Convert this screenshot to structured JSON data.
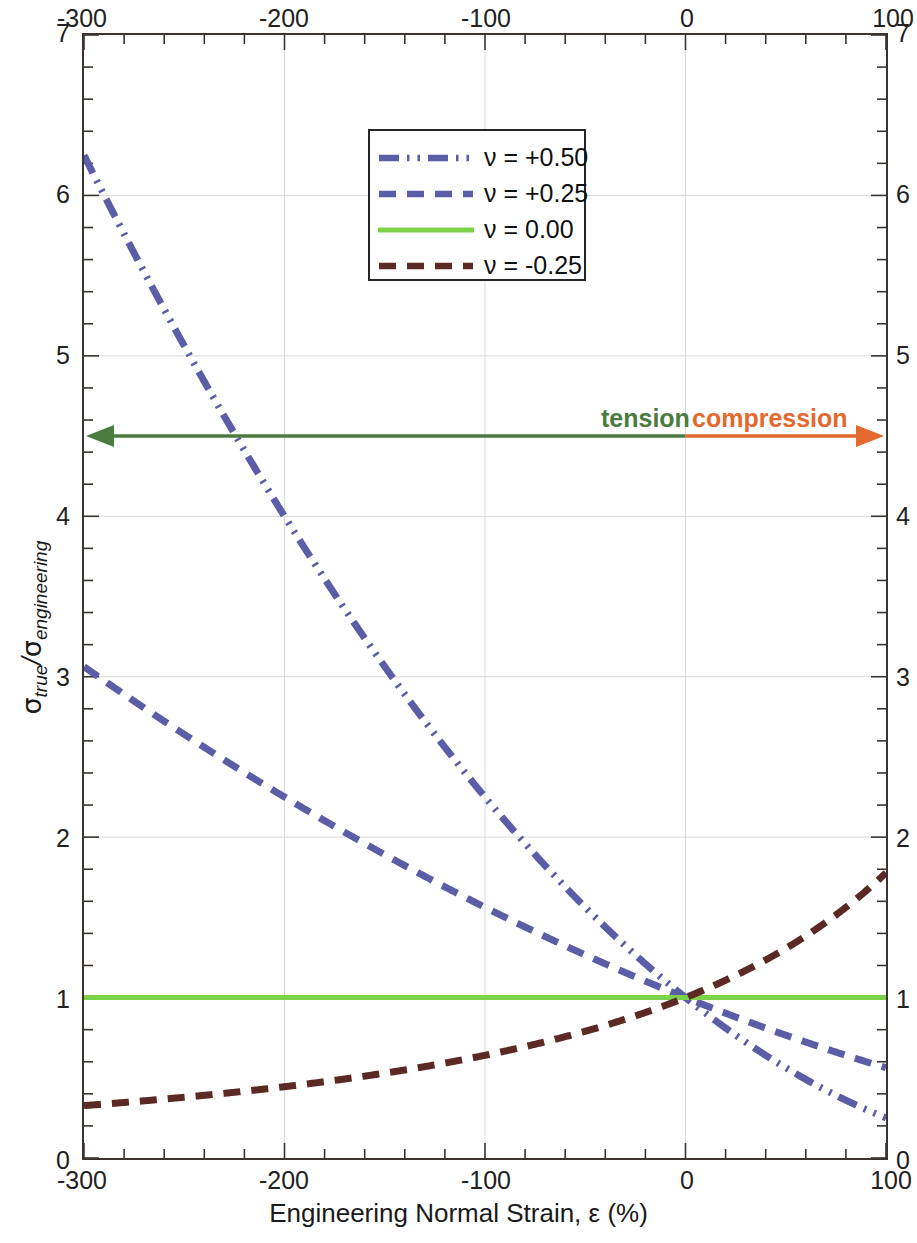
{
  "chart_data": {
    "type": "line",
    "title": "",
    "xlabel": "Engineering Normal Strain, ε (%)",
    "ylabel": "σ_true/σ_engineering",
    "xlim": [
      -300,
      100
    ],
    "ylim": [
      0,
      7
    ],
    "xticks": [
      -300,
      -200,
      -100,
      0,
      100
    ],
    "yticks": [
      0,
      1,
      2,
      3,
      4,
      5,
      6,
      7
    ],
    "xtick_labels": [
      "-300",
      "-200",
      "-100",
      "0",
      "100"
    ],
    "ytick_labels": [
      "0",
      "1",
      "2",
      "3",
      "4",
      "5",
      "6",
      "7"
    ],
    "x_minor_tick_step": 20,
    "y_minor_tick_step": 0.2,
    "grid": true,
    "grid_color": "#d9d9d9",
    "axes_mirrored": true,
    "legend_position": "top-center-inside",
    "series": [
      {
        "name": "ν = +0.50",
        "nu": 0.5,
        "color": "#5b5ea6",
        "dash": "dash-dot-dot",
        "x": [
          -300,
          -280,
          -260,
          -240,
          -220,
          -200,
          -180,
          -160,
          -140,
          -120,
          -100,
          -80,
          -60,
          -40,
          -20,
          0,
          20,
          40,
          60,
          80,
          100
        ],
        "y": [
          4.0,
          3.84,
          3.69,
          3.53,
          3.38,
          3.24,
          3.1,
          2.96,
          2.82,
          2.69,
          2.56,
          2.43,
          2.31,
          2.19,
          2.07,
          1.0,
          0.81,
          0.64,
          0.49,
          0.36,
          0.0
        ]
      },
      {
        "name": "ν = +0.25",
        "nu": 0.25,
        "color": "#5b5ea6",
        "dash": "dash",
        "x": [
          -300,
          -280,
          -260,
          -240,
          -220,
          -200,
          -180,
          -160,
          -140,
          -120,
          -100,
          -80,
          -60,
          -40,
          -20,
          0,
          20,
          40,
          60,
          80,
          100
        ],
        "y": [
          2.0,
          1.94,
          1.88,
          1.82,
          1.76,
          1.7,
          1.64,
          1.58,
          1.52,
          1.46,
          1.4,
          1.33,
          1.26,
          1.19,
          1.1,
          1.0,
          0.9,
          0.81,
          0.72,
          0.64,
          0.56
        ]
      },
      {
        "name": "ν = 0.00",
        "nu": 0.0,
        "color": "#7cd34a",
        "dash": "solid",
        "x": [
          -300,
          100
        ],
        "y": [
          1.0,
          1.0
        ]
      },
      {
        "name": "ν = -0.25",
        "nu": -0.25,
        "color": "#5c2a24",
        "dash": "dash",
        "x": [
          -300,
          -280,
          -260,
          -240,
          -220,
          -200,
          -180,
          -160,
          -140,
          -120,
          -100,
          -80,
          -60,
          -40,
          -20,
          0,
          20,
          40,
          60,
          80,
          90,
          95,
          98,
          100
        ],
        "y": [
          0.51,
          0.52,
          0.53,
          0.55,
          0.57,
          0.59,
          0.62,
          0.65,
          0.68,
          0.73,
          0.78,
          0.83,
          0.88,
          0.92,
          0.96,
          1.0,
          1.12,
          1.3,
          1.6,
          2.2,
          3.0,
          4.2,
          6.0,
          7.0
        ]
      }
    ],
    "annotations": [
      {
        "name": "tension",
        "label": "tension",
        "color": "#4a7c3f",
        "arrow_from_x": 0,
        "arrow_to_x": -300,
        "arrow_y": 4.5
      },
      {
        "name": "compression",
        "label": "compression",
        "color": "#e3692c",
        "arrow_from_x": 0,
        "arrow_to_x": 100,
        "arrow_y": 4.5
      }
    ]
  },
  "axes": {
    "x_top_labels": [
      "-300",
      "-200",
      "-100",
      "0",
      "100"
    ],
    "x_bottom_labels": [
      "-300",
      "-200",
      "-100",
      "0",
      "100"
    ],
    "y_left_labels": [
      "7",
      "6",
      "5",
      "4",
      "3",
      "2",
      "1",
      "0"
    ],
    "y_right_labels": [
      "7",
      "6",
      "5",
      "4",
      "3",
      "2",
      "1",
      "0"
    ],
    "x_title": "Engineering Normal Strain, ε (%)",
    "y_title_parts": {
      "sigma": "σ",
      "sub_true": "true",
      "slash": "/",
      "sub_engineering": "engineering"
    }
  },
  "legend": {
    "entries": [
      {
        "label": "ν = +0.50"
      },
      {
        "label": "ν = +0.25"
      },
      {
        "label": "ν = 0.00"
      },
      {
        "label": "ν = -0.25"
      }
    ]
  }
}
